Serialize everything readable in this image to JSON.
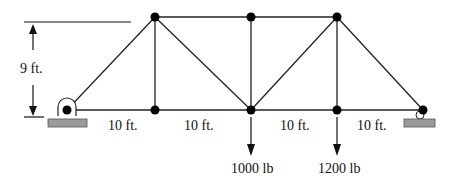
{
  "diagram": {
    "type": "truss",
    "height_label": "9 ft.",
    "span_labels": [
      "10 ft.",
      "10 ft.",
      "10 ft.",
      "10 ft."
    ],
    "loads": [
      {
        "label": "1000 lb",
        "node": "bottom-middle"
      },
      {
        "label": "1200 lb",
        "node": "bottom-right-inner"
      }
    ],
    "supports": [
      {
        "type": "pin",
        "position": "left"
      },
      {
        "type": "roller",
        "position": "right"
      }
    ],
    "colors": {
      "member": "#222222",
      "joint": "#000000",
      "support_block": "#9a9a9a"
    }
  }
}
